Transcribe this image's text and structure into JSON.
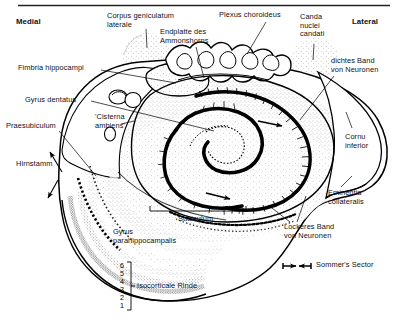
{
  "figure": {
    "orientation": {
      "medial_label": "Medial",
      "lateral_label": "Lateral"
    },
    "top_rule": true,
    "ink_color": "#000000",
    "paper_color": "#ffffff",
    "stipple_color": "#4a4a4a"
  },
  "labels": [
    {
      "id": "medial",
      "text": "Medial",
      "x": 16,
      "y": 20,
      "bold": true
    },
    {
      "id": "lateral",
      "text": "Lateral",
      "x": 352,
      "y": 20,
      "bold": true
    },
    {
      "id": "corpus-geniculatum",
      "text": "Corpus geniculatum\nlaterale",
      "x": 107,
      "y": 14,
      "bold": false
    },
    {
      "id": "endplatte",
      "text": "Endplatte des\nAmmonshorns",
      "x": 160,
      "y": 30,
      "bold": false
    },
    {
      "id": "plexus-choroideus",
      "text": "Plexus choroideus",
      "x": 219,
      "y": 13,
      "bold": false
    },
    {
      "id": "canda-nuclei",
      "text": "Canda\nnuclei\ncandati",
      "x": 300,
      "y": 14,
      "bold": false
    },
    {
      "id": "dichtes-band",
      "text": "dichtes Band\nvon Neuronen",
      "x": 331,
      "y": 59,
      "bold": false
    },
    {
      "id": "fimbria",
      "text": "Fimbria hippocampi",
      "x": 18,
      "y": 67,
      "bold": false
    },
    {
      "id": "gyrus-dentatus",
      "text": "Gyrus dentatus",
      "x": 25,
      "y": 98,
      "bold": false
    },
    {
      "id": "cisterna-ambiens",
      "text": "'Cisterna\nambiens'",
      "x": 95,
      "y": 116,
      "bold": false
    },
    {
      "id": "praesubiculum",
      "text": "Praesubiculum",
      "x": 8,
      "y": 124,
      "bold": false
    },
    {
      "id": "hirnstamm",
      "text": "Hirnstamm",
      "x": 16,
      "y": 162,
      "bold": false
    },
    {
      "id": "cornu-inferior",
      "text": "Cornu\ninferior",
      "x": 345,
      "y": 135,
      "bold": false
    },
    {
      "id": "eminentia",
      "text": "Eminentia\ncollateralis",
      "x": 330,
      "y": 191,
      "bold": false
    },
    {
      "id": "lockeres-band",
      "text": "Lockeres Band\nvon Neuronen",
      "x": 285,
      "y": 225,
      "bold": false
    },
    {
      "id": "subiculum",
      "text": "Subiculum",
      "x": 178,
      "y": 219,
      "bold": false
    },
    {
      "id": "gyrus-para",
      "text": "Gyrus\nparahippocampalis",
      "x": 113,
      "y": 230,
      "bold": false
    },
    {
      "id": "isocorticale",
      "text": "Isocorticale Rinde",
      "x": 137,
      "y": 279,
      "bold": false
    },
    {
      "id": "sommers-sector",
      "text": "Sommer's Sector",
      "x": 316,
      "y": 259,
      "bold": false
    }
  ],
  "cortical_layers": {
    "numbers": [
      "6",
      "5",
      "4",
      "3",
      "2",
      "1"
    ],
    "brace_label": "Isocorticale Rinde"
  },
  "markers": {
    "sommers_sector": {
      "label": "Sommer's Sector",
      "style": "double-headed-span-arrow"
    },
    "subiculum_span": {
      "label": "Subiculum",
      "style": "horizontal-span-line"
    }
  },
  "structures": [
    "cornu ammonis pyramidal band",
    "gyrus dentatus granule layer",
    "fimbria hippocampi",
    "choroid plexus",
    "lateral geniculate body",
    "tail of caudate nucleus",
    "temporal horn of lateral ventricle",
    "collateral eminence",
    "parahippocampal gyrus isocortex"
  ]
}
